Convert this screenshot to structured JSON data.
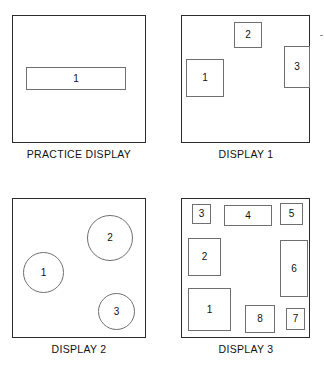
{
  "figure": {
    "width": 324,
    "height": 368,
    "background_color": "#ffffff",
    "frame_color": "#2b2b2b",
    "shape_outline_color": "#6f6f6f",
    "label_color": "#111111"
  },
  "panels": [
    {
      "id": "practice-display",
      "caption": "PRACTICE DISPLAY",
      "frame": {
        "x": 12,
        "y": 15,
        "w": 134,
        "h": 128
      },
      "caption_box": {
        "x": 2,
        "y": 148,
        "w": 154,
        "h": 14
      },
      "shapes": [
        {
          "label": "1",
          "type": "rect",
          "x": 26,
          "y": 67,
          "w": 100,
          "h": 23
        }
      ]
    },
    {
      "id": "display-1",
      "caption": "DISPLAY 1",
      "frame": {
        "x": 181,
        "y": 15,
        "w": 129,
        "h": 128
      },
      "caption_box": {
        "x": 170,
        "y": 148,
        "w": 152,
        "h": 14
      },
      "shapes": [
        {
          "label": "1",
          "type": "rect",
          "x": 186,
          "y": 59,
          "w": 38,
          "h": 38
        },
        {
          "label": "2",
          "type": "rect",
          "x": 234,
          "y": 22,
          "w": 28,
          "h": 26
        },
        {
          "label": "3",
          "type": "rect",
          "x": 284,
          "y": 46,
          "w": 26,
          "h": 42
        }
      ]
    },
    {
      "id": "display-2",
      "caption": "DISPLAY 2",
      "frame": {
        "x": 12,
        "y": 198,
        "w": 134,
        "h": 140
      },
      "caption_box": {
        "x": 2,
        "y": 343,
        "w": 154,
        "h": 14
      },
      "shapes": [
        {
          "label": "1",
          "type": "circle",
          "x": 23,
          "y": 252,
          "w": 41,
          "h": 41
        },
        {
          "label": "2",
          "type": "circle",
          "x": 87,
          "y": 215,
          "w": 46,
          "h": 46
        },
        {
          "label": "3",
          "type": "circle",
          "x": 98,
          "y": 293,
          "w": 37,
          "h": 37
        }
      ]
    },
    {
      "id": "display-3",
      "caption": "DISPLAY 3",
      "frame": {
        "x": 181,
        "y": 198,
        "w": 129,
        "h": 140
      },
      "caption_box": {
        "x": 170,
        "y": 343,
        "w": 152,
        "h": 14
      },
      "shapes": [
        {
          "label": "3",
          "type": "rect",
          "x": 192,
          "y": 204,
          "w": 19,
          "h": 20
        },
        {
          "label": "4",
          "type": "rect",
          "x": 224,
          "y": 205,
          "w": 48,
          "h": 21
        },
        {
          "label": "5",
          "type": "rect",
          "x": 280,
          "y": 203,
          "w": 23,
          "h": 22
        },
        {
          "label": "2",
          "type": "rect",
          "x": 188,
          "y": 238,
          "w": 33,
          "h": 38
        },
        {
          "label": "6",
          "type": "rect",
          "x": 280,
          "y": 240,
          "w": 28,
          "h": 57
        },
        {
          "label": "1",
          "type": "rect",
          "x": 188,
          "y": 288,
          "w": 43,
          "h": 43
        },
        {
          "label": "8",
          "type": "rect",
          "x": 245,
          "y": 305,
          "w": 30,
          "h": 28
        },
        {
          "label": "7",
          "type": "rect",
          "x": 286,
          "y": 308,
          "w": 19,
          "h": 22
        }
      ]
    }
  ],
  "marks": [
    {
      "id": "edge-tick",
      "x": 320,
      "y": 35,
      "w": 3,
      "h": 1
    }
  ]
}
